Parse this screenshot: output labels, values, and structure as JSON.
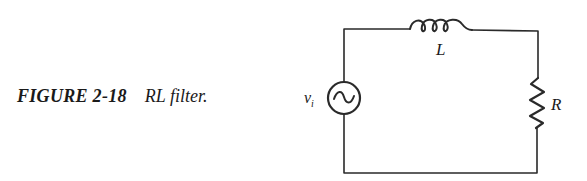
{
  "figure": {
    "number": "FIGURE 2-18",
    "title": "RL filter."
  },
  "circuit": {
    "source_label": "v",
    "source_subscript": "i",
    "inductor_label": "L",
    "resistor_label": "R",
    "components": [
      {
        "type": "ac-voltage-source",
        "label": "v_i"
      },
      {
        "type": "inductor",
        "label": "L"
      },
      {
        "type": "resistor",
        "label": "R"
      }
    ],
    "stroke_color": "#2a2a2a"
  }
}
